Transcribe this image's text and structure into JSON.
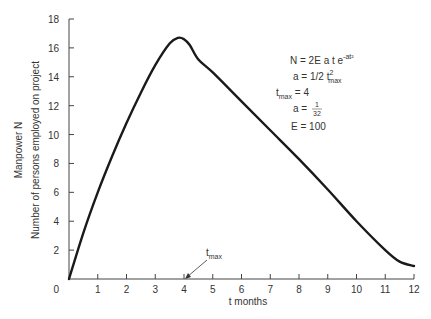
{
  "chart_data": {
    "type": "line",
    "title": "",
    "xlabel": "t months",
    "ylabel_line1": "Manpower N",
    "ylabel_line2": "Number of persons employed on project",
    "xlim": [
      0,
      12
    ],
    "ylim": [
      0,
      18
    ],
    "x_ticks": [
      0,
      1,
      2,
      3,
      4,
      5,
      6,
      7,
      8,
      9,
      10,
      11,
      12
    ],
    "y_ticks": [
      0,
      2,
      4,
      6,
      8,
      10,
      12,
      14,
      16,
      18
    ],
    "grid": false,
    "series": [
      {
        "name": "N(t)",
        "x": [
          0,
          0.5,
          1,
          1.5,
          2,
          2.5,
          3,
          3.5,
          3.8,
          4,
          4.2,
          4.5,
          5,
          6,
          7,
          8,
          9,
          10,
          11,
          11.5,
          12
        ],
        "values": [
          0,
          3.2,
          6.0,
          8.5,
          10.8,
          12.9,
          14.8,
          16.3,
          16.7,
          16.6,
          16.2,
          15.2,
          14.3,
          12.3,
          10.3,
          8.3,
          6.2,
          4.0,
          2.0,
          1.2,
          0.9
        ]
      }
    ],
    "annotations": [
      {
        "text": "t",
        "sub": "max",
        "x": 4,
        "y": 0,
        "arrow": true
      }
    ],
    "equations": [
      {
        "main": "N = 2E a t e",
        "sup": "-at²"
      },
      {
        "main": "a = 1/2 t",
        "sup": "2",
        "sub": "max"
      },
      {
        "main": "t",
        "sub": "max",
        "tail": " = 4"
      },
      {
        "main": "a = ",
        "frac_num": "1",
        "frac_den": "32"
      },
      {
        "main": "E = 100"
      }
    ]
  }
}
